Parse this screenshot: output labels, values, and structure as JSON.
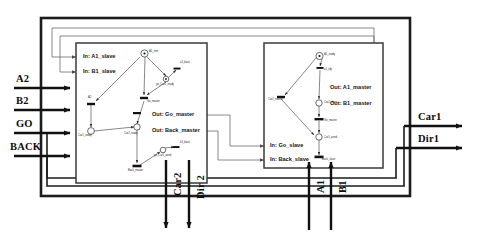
{
  "diagram": {
    "colors": {
      "outer_frame": "#1c1c1c",
      "module_border": "#3a3a3a",
      "wire": "#4d4d4d",
      "signal_arrow": "#111111",
      "node_stroke": "#2b2b2b",
      "background": "#ffffff"
    }
  },
  "external_inputs": [
    {
      "label": "A2",
      "y": 88
    },
    {
      "label": "B2",
      "y": 110
    },
    {
      "label": "GO",
      "y": 133
    },
    {
      "label": "BACK",
      "y": 156
    }
  ],
  "external_outputs": [
    {
      "label": "Car1",
      "y": 126
    },
    {
      "label": "Dir1",
      "y": 148
    }
  ],
  "bottom_outputs": [
    {
      "label": "Car2",
      "x": 173
    },
    {
      "label": "Dir 2",
      "x": 196
    }
  ],
  "bottom_inputs": [
    {
      "label": "A1",
      "x": 316
    },
    {
      "label": "B1",
      "x": 338
    }
  ],
  "slave_module": {
    "name": "slave-module",
    "inputs": [
      {
        "label": "In: A1_slave",
        "x": 83,
        "y": 57
      },
      {
        "label": "In: B1_slave",
        "x": 83,
        "y": 72
      }
    ],
    "outputs": [
      {
        "label": "Out: Go_master",
        "x": 152,
        "y": 115
      },
      {
        "label": "Out: Back_master",
        "x": 152,
        "y": 131
      }
    ],
    "nodes": [
      {
        "label": "A1_rem",
        "x": 149,
        "y": 53,
        "kind": "place-token",
        "cx": 144.5,
        "cy": 53.5,
        "r": 3.6
      },
      {
        "label": "a1_back",
        "x": 180,
        "y": 64,
        "kind": "transition",
        "cx": 177,
        "cy": 68.5,
        "w": 7,
        "h": 2
      },
      {
        "label": "go_Car1_ready",
        "x": 158,
        "y": 85,
        "kind": "place",
        "cx": 166,
        "cy": 79,
        "r": 2.8
      },
      {
        "label": "Go_master",
        "x": 149,
        "y": 102,
        "kind": "transition",
        "cx": 144,
        "cy": 98,
        "w": 8,
        "h": 2.4
      },
      {
        "label": "A2",
        "x": 88,
        "y": 98,
        "kind": "transition",
        "cx": 91,
        "cy": 104,
        "w": 8,
        "h": 2.4
      },
      {
        "label": "Car1_ready",
        "x": 78,
        "y": 130,
        "kind": "place",
        "cx": 91,
        "cy": 131,
        "r": 3.4
      },
      {
        "label": "Car2_ready",
        "x": 120,
        "y": 144,
        "kind": "place",
        "cx": 137,
        "cy": 127,
        "r": 3.2
      },
      {
        "label": "go_Car1_aend",
        "x": 156,
        "y": 155,
        "kind": "place",
        "cx": 163,
        "cy": 150,
        "r": 2.8
      },
      {
        "label": "b1_back",
        "x": 178,
        "y": 143,
        "kind": "transition",
        "cx": 176,
        "cy": 147,
        "w": 7,
        "h": 2
      },
      {
        "label": "Back_master",
        "x": 128,
        "y": 172,
        "kind": "transition",
        "cx": 137,
        "cy": 166,
        "w": 9,
        "h": 2.6
      }
    ]
  },
  "master_module": {
    "name": "master-module",
    "inputs": [
      {
        "label": "In: Go_slave",
        "x": 270,
        "y": 146
      },
      {
        "label": "In: Back_slave",
        "x": 270,
        "y": 160
      }
    ],
    "outputs": [
      {
        "label": "Out: A1_master",
        "x": 330,
        "y": 88
      },
      {
        "label": "Out: B1_master",
        "x": 330,
        "y": 104
      }
    ],
    "nodes": [
      {
        "label": "A1_ready",
        "x": 324,
        "y": 56,
        "kind": "place-token",
        "cx": 319.5,
        "cy": 56,
        "r": 3.6
      },
      {
        "label": "a1_rdy",
        "x": 324,
        "y": 70,
        "kind": "transition",
        "cx": 320,
        "cy": 68,
        "w": 7,
        "h": 2
      },
      {
        "label": "Car2_slave",
        "x": 325,
        "y": 105,
        "kind": "place",
        "cx": 319,
        "cy": 103,
        "r": 3.2
      },
      {
        "label": "Go_master",
        "x": 325,
        "y": 122,
        "kind": "transition",
        "cx": 319,
        "cy": 119,
        "w": 9,
        "h": 2.4
      },
      {
        "label": "Car1_aend",
        "x": 325,
        "y": 140,
        "kind": "place",
        "cx": 319,
        "cy": 137,
        "r": 3.2
      },
      {
        "label": "Back_slave",
        "x": 322,
        "y": 162,
        "kind": "transition",
        "cx": 319,
        "cy": 157,
        "w": 9,
        "h": 2.6
      },
      {
        "label": "Car2_master",
        "x": 272,
        "y": 100,
        "kind": "transition",
        "cx": 281,
        "cy": 97,
        "w": 8,
        "h": 2.4
      }
    ]
  }
}
